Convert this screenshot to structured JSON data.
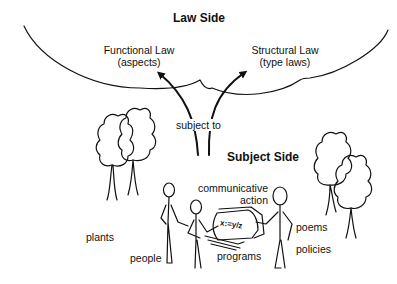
{
  "law_side": {
    "title": "Law Side",
    "functional_law": {
      "line1": "Functional Law",
      "line2": "(aspects)"
    },
    "structural_law": {
      "line1": "Structural Law",
      "line2": "(type laws)"
    }
  },
  "relation": {
    "label": "subject to"
  },
  "subject_side": {
    "title": "Subject Side",
    "communicative_action": {
      "line1": "communicative",
      "line2": "action"
    },
    "screen_formula": "x:=y/z",
    "items": {
      "plants": "plants",
      "people": "people",
      "programs": "programs",
      "poems": "poems",
      "policies": "policies"
    }
  },
  "colors": {
    "ink": "#111111",
    "background": "#ffffff"
  }
}
